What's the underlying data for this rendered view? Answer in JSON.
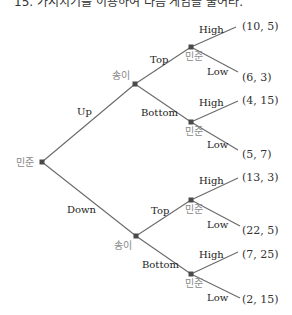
{
  "title": "15. 가지치기를 이용하여 다음 게임을 풀어라.",
  "players": {
    "root": "민준",
    "second": "송이",
    "third": "민준"
  },
  "moves": {
    "first": [
      "Up",
      "Down"
    ],
    "second": [
      "Top",
      "Bottom"
    ],
    "third": [
      "High",
      "Low"
    ]
  },
  "payoffs": [
    "(10, 5)",
    "(6, 3)",
    "(4, 15)",
    "(5, 7)",
    "(13, 3)",
    "(22, 5)",
    "(7, 25)",
    "(2, 15)"
  ],
  "tree": {
    "label": "민준",
    "children": [
      {
        "move": "Up",
        "label": "송이",
        "children": [
          {
            "move": "Top",
            "label": "민준",
            "children": [
              {
                "move": "High",
                "payoff": "(10, 5)"
              },
              {
                "move": "Low",
                "payoff": "(6, 3)"
              }
            ]
          },
          {
            "move": "Bottom",
            "label": "민준",
            "children": [
              {
                "move": "High",
                "payoff": "(4, 15)"
              },
              {
                "move": "Low",
                "payoff": "(5, 7)"
              }
            ]
          }
        ]
      },
      {
        "move": "Down",
        "label": "송이",
        "children": [
          {
            "move": "Top",
            "label": "민준",
            "children": [
              {
                "move": "High",
                "payoff": "(13, 3)"
              },
              {
                "move": "Low",
                "payoff": "(22, 5)"
              }
            ]
          },
          {
            "move": "Bottom",
            "label": "민준",
            "children": [
              {
                "move": "High",
                "payoff": "(7, 25)"
              },
              {
                "move": "Low",
                "payoff": "(2, 15)"
              }
            ]
          }
        ]
      }
    ]
  }
}
